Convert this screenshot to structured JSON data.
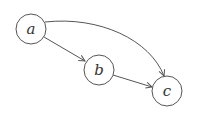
{
  "diagram": {
    "type": "directed-graph",
    "nodes": [
      {
        "id": "a",
        "label": "a",
        "cx": 31,
        "cy": 29,
        "r": 15
      },
      {
        "id": "b",
        "label": "b",
        "cx": 99,
        "cy": 70,
        "r": 15
      },
      {
        "id": "c",
        "label": "c",
        "cx": 167,
        "cy": 91,
        "r": 15
      }
    ],
    "edges": [
      {
        "from": "a",
        "to": "b",
        "style": "straight"
      },
      {
        "from": "b",
        "to": "c",
        "style": "straight"
      },
      {
        "from": "a",
        "to": "c",
        "style": "curved"
      }
    ],
    "stroke_color": "#555555"
  }
}
